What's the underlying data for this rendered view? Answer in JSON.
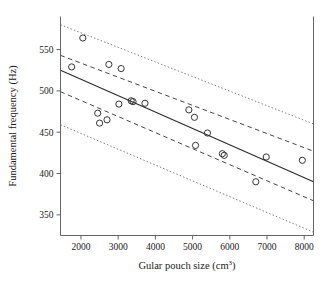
{
  "chart_data": {
    "type": "scatter",
    "title": "",
    "xlabel": "Gular pouch size (cm3)",
    "xlabel_base": "Gular pouch size (cm",
    "xlabel_sup": "3",
    "xlabel_close": ")",
    "ylabel": "Fundamental frequency (Hz)",
    "xlim": [
      1450,
      8250
    ],
    "ylim": [
      325,
      590
    ],
    "xticks": [
      2000,
      3000,
      4000,
      5000,
      6000,
      7000,
      8000
    ],
    "xtick_labels": [
      "2000",
      "3000",
      "4000",
      "5000",
      "6000",
      "7000",
      "8000"
    ],
    "yticks": [
      350,
      400,
      450,
      500,
      550
    ],
    "ytick_labels": [
      "350",
      "400",
      "450",
      "500",
      "550"
    ],
    "grid": false,
    "legend": "none",
    "marker": "open-circle",
    "points": [
      {
        "x": 1750,
        "y": 529
      },
      {
        "x": 2050,
        "y": 564
      },
      {
        "x": 2450,
        "y": 473
      },
      {
        "x": 2500,
        "y": 461
      },
      {
        "x": 2700,
        "y": 465
      },
      {
        "x": 2750,
        "y": 532
      },
      {
        "x": 3020,
        "y": 484
      },
      {
        "x": 3080,
        "y": 527
      },
      {
        "x": 3350,
        "y": 488
      },
      {
        "x": 3400,
        "y": 487
      },
      {
        "x": 3720,
        "y": 485
      },
      {
        "x": 4900,
        "y": 477
      },
      {
        "x": 5050,
        "y": 468
      },
      {
        "x": 5080,
        "y": 434
      },
      {
        "x": 5400,
        "y": 449
      },
      {
        "x": 5800,
        "y": 424
      },
      {
        "x": 5850,
        "y": 422
      },
      {
        "x": 6700,
        "y": 390
      },
      {
        "x": 6980,
        "y": 420
      },
      {
        "x": 7950,
        "y": 416
      }
    ],
    "fit_line": {
      "name": "regression-line",
      "style": "solid",
      "x0": 1450,
      "y0": 525,
      "x1": 8250,
      "y1": 390
    },
    "confidence_band": {
      "name": "confidence-interval",
      "style": "dashed",
      "upper": {
        "x0": 1450,
        "y0": 543,
        "x1": 8250,
        "y1": 427
      },
      "lower": {
        "x0": 1450,
        "y0": 499,
        "x1": 8250,
        "y1": 367
      }
    },
    "prediction_band": {
      "name": "prediction-interval",
      "style": "dotted",
      "upper": {
        "x0": 1450,
        "y0": 580,
        "x1": 8250,
        "y1": 460
      },
      "lower": {
        "x0": 1450,
        "y0": 459,
        "x1": 8250,
        "y1": 329
      }
    }
  }
}
